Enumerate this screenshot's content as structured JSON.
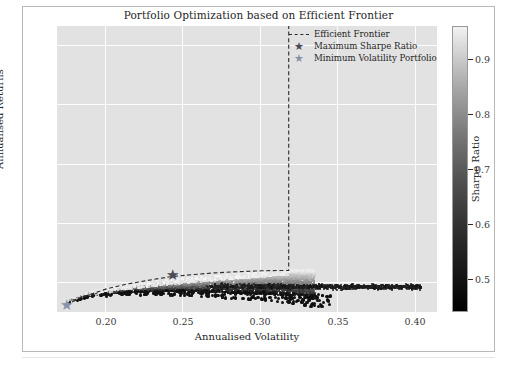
{
  "figure": {
    "title": "Portfolio Optimization based on Efficient Frontier",
    "background": "#ffffff",
    "plot_background": "#e2e2e2",
    "grid_color": "#fdfdfd"
  },
  "legend": {
    "position": "upper-center-right",
    "entries": [
      {
        "label": "Efficient Frontier",
        "marker": "dashed-line-icon",
        "color": "#2b2b2b"
      },
      {
        "label": "Maximum Sharpe Ratio",
        "marker": "star-icon",
        "color": "#4a4a55"
      },
      {
        "label": "Minimum Volatility Portfolio",
        "marker": "star-icon",
        "color": "#8892a8"
      }
    ]
  },
  "colorbar": {
    "title": "Sharpe Ratio",
    "ticks": [
      0.5,
      0.6,
      0.7,
      0.8,
      0.9
    ],
    "tick_labels": [
      "0.5",
      "0.6",
      "0.7",
      "0.8",
      "0.9"
    ],
    "vmin": 0.44,
    "vmax": 0.96,
    "colormap": "gray-dark-to-light"
  },
  "chart_data": {
    "type": "scatter",
    "title": "Portfolio Optimization based on Efficient Frontier",
    "xlabel": "Annualised Volatility",
    "ylabel": "Annualised Returns",
    "xlim": [
      0.168,
      0.414
    ],
    "ylim": [
      0.11,
      1.075
    ],
    "xticks": [
      0.2,
      0.25,
      0.3,
      0.35,
      0.4
    ],
    "xtick_labels": [
      "0.20",
      "0.25",
      "0.30",
      "0.35",
      "0.40"
    ],
    "yticks": [
      0.2,
      0.4,
      0.6,
      0.8,
      1.0
    ],
    "ytick_labels": [
      "0.2",
      "0.4",
      "0.6",
      "0.8",
      "1.0"
    ],
    "grid": true,
    "colorbar_variable": "Sharpe Ratio",
    "series": [
      {
        "name": "Simulated Portfolios",
        "type": "scatter",
        "color_by": "Sharpe Ratio",
        "note": "Dense comet-shaped cloud of random portfolios; bright (high Sharpe) upper envelope, dark low-Sharpe points below and along a long thin tail near y=0.195 extending to x=0.40"
      },
      {
        "name": "Efficient Frontier",
        "type": "line",
        "linestyle": "dashed",
        "color": "#2b2b2b",
        "x": [
          0.174,
          0.18,
          0.19,
          0.2,
          0.212,
          0.225,
          0.24,
          0.255,
          0.27,
          0.285,
          0.3,
          0.312,
          0.318,
          0.318,
          0.318
        ],
        "y": [
          0.133,
          0.15,
          0.17,
          0.188,
          0.203,
          0.215,
          0.228,
          0.236,
          0.242,
          0.246,
          0.249,
          0.25,
          0.25,
          0.6,
          1.075
        ]
      }
    ],
    "markers": [
      {
        "name": "Maximum Sharpe Ratio",
        "x": 0.2425,
        "y": 0.2305,
        "marker": "star",
        "color": "#4a4a55"
      },
      {
        "name": "Minimum Volatility Portfolio",
        "x": 0.1742,
        "y": 0.1315,
        "marker": "star",
        "color": "#8892a8"
      }
    ],
    "annotations": [
      "Vertical dashed frontier segment at x = 0.318 rising to the top of the axes",
      "Low-Sharpe tail points flatten near y = 0.195 from x = 0.27 to x = 0.40"
    ]
  }
}
